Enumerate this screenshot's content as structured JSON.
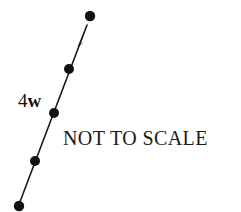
{
  "figure": {
    "type": "geometry-diagram",
    "width": 241,
    "height": 212,
    "background_color": "#ffffff",
    "stroke_color": "#1a1a1a",
    "dot_color": "#111111",
    "labels": {
      "measure_number": "4",
      "measure_variable": "w",
      "measure_full": "4w",
      "note": "NOT TO SCALE"
    },
    "line": {
      "description": "upward-right sloping ray with arrowhead at top",
      "start": {
        "x": 18,
        "y": 207
      },
      "end": {
        "x": 87,
        "y": 25
      },
      "stroke_width": 1.6
    },
    "arrowhead": {
      "tip_x": 88,
      "tip_y": 23,
      "length": 22,
      "half_width": 4.5
    },
    "points": [
      {
        "name": "point-top-detached",
        "x": 90,
        "y": 16,
        "r": 5.2
      },
      {
        "name": "point-2",
        "x": 69,
        "y": 69,
        "r": 5.0
      },
      {
        "name": "point-3",
        "x": 54,
        "y": 113,
        "r": 5.0
      },
      {
        "name": "point-4",
        "x": 35,
        "y": 161,
        "r": 5.0
      },
      {
        "name": "point-bottom",
        "x": 19,
        "y": 206,
        "r": 5.2
      }
    ]
  }
}
